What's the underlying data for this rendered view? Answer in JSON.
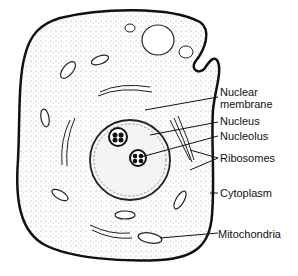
{
  "diagram": {
    "labels": {
      "nuclear_membrane_1": "Nuclear",
      "nuclear_membrane_2": "membrane",
      "nucleus": "Nucleus",
      "nucleolus": "Nucleolus",
      "ribosomes": "Ribosomes",
      "cytoplasm": "Cytoplasm",
      "mitochondria": "Mitochondria"
    }
  }
}
